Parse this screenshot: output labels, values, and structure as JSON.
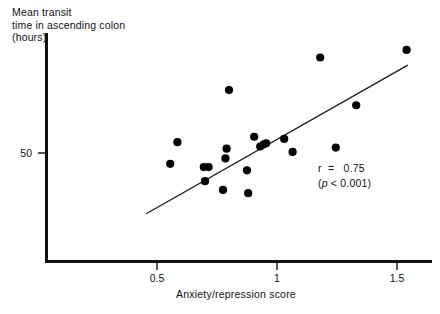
{
  "figure": {
    "background": "#ffffff",
    "ink_color": "#111111"
  },
  "chart_data": {
    "type": "scatter",
    "title": "",
    "ylabel": "Mean transit\ntime in ascending colon\n(hours)",
    "xlabel": "Anxiety/repression score",
    "xticks": [
      0.5,
      1,
      1.5
    ],
    "xtick_labels": [
      "0.5",
      "1",
      "1.5"
    ],
    "yticks": [
      50
    ],
    "ytick_labels": [
      "50"
    ],
    "xlim": [
      0.36,
      1.58
    ],
    "ylim": [
      0.0,
      105.0
    ],
    "grid": false,
    "legend": null,
    "marker": {
      "shape": "circle",
      "color": "#000000",
      "size_px": 5.4
    },
    "points": [
      {
        "x": 0.555,
        "y": 45.0
      },
      {
        "x": 0.585,
        "y": 55.0
      },
      {
        "x": 0.695,
        "y": 43.5
      },
      {
        "x": 0.715,
        "y": 43.5
      },
      {
        "x": 0.7,
        "y": 37.0
      },
      {
        "x": 0.79,
        "y": 52.0
      },
      {
        "x": 0.775,
        "y": 33.0
      },
      {
        "x": 0.785,
        "y": 47.5
      },
      {
        "x": 0.8,
        "y": 79.0
      },
      {
        "x": 0.875,
        "y": 42.0
      },
      {
        "x": 0.88,
        "y": 31.5
      },
      {
        "x": 0.905,
        "y": 57.5
      },
      {
        "x": 0.93,
        "y": 53.0
      },
      {
        "x": 0.945,
        "y": 54.0
      },
      {
        "x": 0.955,
        "y": 54.5
      },
      {
        "x": 1.03,
        "y": 56.5
      },
      {
        "x": 1.065,
        "y": 50.5
      },
      {
        "x": 1.18,
        "y": 94.0
      },
      {
        "x": 1.245,
        "y": 52.5
      },
      {
        "x": 1.33,
        "y": 72.0
      },
      {
        "x": 1.54,
        "y": 97.5
      }
    ],
    "trendline": {
      "type": "linear-fit",
      "x_start": 0.455,
      "y_start": 22.0,
      "x_end": 1.545,
      "y_end": 90.5
    },
    "annotations": {
      "r_label": "r",
      "r_equals": "=",
      "r_value": "0.75",
      "r_line": "r  =   0.75",
      "p_prefix": "(",
      "p_symbol": "p",
      "p_rest": " < 0.001)"
    }
  },
  "axis": {
    "x_title": "Anxiety/repression score",
    "y_title_line1": "Mean transit",
    "y_title_line2": "time in ascending colon",
    "y_title_line3": "(hours)"
  }
}
